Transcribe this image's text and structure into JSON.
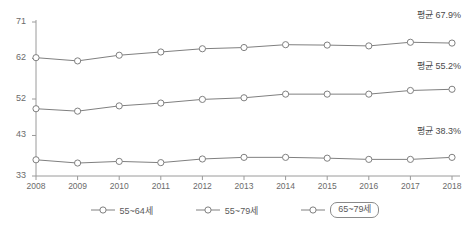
{
  "chart_data": {
    "type": "line",
    "title": "",
    "subtitle": "",
    "xlabel": "",
    "ylabel": "",
    "categories": [
      "2008",
      "2009",
      "2010",
      "2011",
      "2012",
      "2013",
      "2014",
      "2015",
      "2016",
      "2017",
      "2018"
    ],
    "ylim": [
      33,
      71
    ],
    "yticks": [
      33,
      43,
      52,
      62,
      71
    ],
    "ytick_labels": [
      "33",
      "43",
      "52",
      "62",
      "71"
    ],
    "grid": false,
    "legend_position": "bottom",
    "series": [
      {
        "name": "55~64세",
        "color": "#808080",
        "values": [
          62.2,
          61.4,
          62.8,
          63.6,
          64.4,
          64.7,
          65.4,
          65.3,
          65.1,
          66.0,
          65.8
        ]
      },
      {
        "name": "55~79세",
        "color": "#808080",
        "values": [
          49.6,
          49.0,
          50.3,
          51.0,
          51.9,
          52.3,
          53.2,
          53.2,
          53.2,
          54.1,
          54.4
        ]
      },
      {
        "name": "65~79세",
        "color": "#808080",
        "values": [
          37.0,
          36.2,
          36.6,
          36.3,
          37.2,
          37.6,
          37.6,
          37.4,
          37.1,
          37.1,
          37.6
        ]
      }
    ],
    "annotations": [
      {
        "text": "평균 67.9%",
        "series": "55~64세"
      },
      {
        "text": "평균 55.2%",
        "series": "55~79세"
      },
      {
        "text": "평균 38.3%",
        "series": "65~79세"
      }
    ]
  },
  "axis": {
    "y_labels": [
      "71",
      "62",
      "52",
      "43",
      "33"
    ],
    "x_labels": [
      "2008",
      "2009",
      "2010",
      "2011",
      "2012",
      "2013",
      "2014",
      "2015",
      "2016",
      "2017",
      "2018"
    ]
  },
  "annotations": {
    "top": "평균 67.9%",
    "middle": "평균 55.2%",
    "bottom": "평균 38.3%"
  },
  "legend": {
    "items": [
      {
        "label": "55~64세",
        "boxed": false
      },
      {
        "label": "55~79세",
        "boxed": false
      },
      {
        "label": "65~79세",
        "boxed": true
      }
    ]
  },
  "colors": {
    "line": "#808080",
    "marker_fill": "#ffffff",
    "axis": "#9a9a9a",
    "text": "#5a5a5a"
  }
}
